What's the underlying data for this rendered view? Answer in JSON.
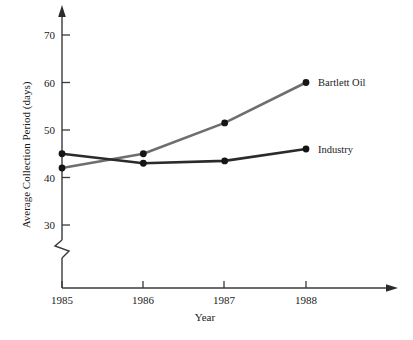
{
  "chart_data": {
    "type": "line",
    "title": "",
    "xlabel": "Year",
    "ylabel": "Average Collection Period (days)",
    "categories": [
      "1985",
      "1986",
      "1987",
      "1988"
    ],
    "x": [
      1985,
      1986,
      1987,
      1988
    ],
    "xlim": [
      1985,
      1988
    ],
    "ylim": [
      30,
      70
    ],
    "yticks": [
      "30",
      "40",
      "50",
      "60",
      "70"
    ],
    "ytick_values": [
      30,
      40,
      50,
      60,
      70
    ],
    "grid": false,
    "legend_position": "right-inline-labels",
    "axis_break": true,
    "axis_break_note": "zigzag break on y-axis below 30",
    "series": [
      {
        "name": "Bartlett Oil",
        "color": "#6e6e6e",
        "values": [
          42,
          45,
          51.5,
          60
        ]
      },
      {
        "name": "Industry",
        "color": "#2b2b2b",
        "values": [
          45,
          43,
          43.5,
          46
        ]
      }
    ]
  },
  "axes": {
    "y_title": "Average Collection Period (days)",
    "x_title": "Year",
    "y_tick_70": "70",
    "y_tick_60": "60",
    "y_tick_50": "50",
    "y_tick_40": "40",
    "y_tick_30": "30",
    "x_tick_1985": "1985",
    "x_tick_1986": "1986",
    "x_tick_1987": "1987",
    "x_tick_1988": "1988"
  },
  "series_labels": {
    "bartlett_oil": "Bartlett Oil",
    "industry": "Industry"
  },
  "colors": {
    "bartlett_oil_line": "#6e6e6e",
    "industry_line": "#2b2b2b",
    "axis": "#3a3a3a",
    "marker": "#151515",
    "background": "#ffffff"
  }
}
